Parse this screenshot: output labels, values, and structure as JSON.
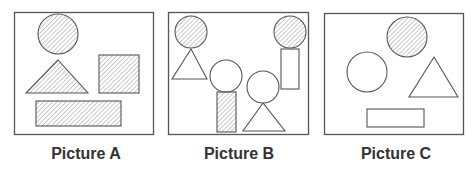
{
  "colors": {
    "stroke": "#555555",
    "frame": "#555555",
    "hatch": "#9a9a9a",
    "caption": "#333333",
    "background": "#ffffff"
  },
  "pictures": [
    {
      "id": "A",
      "label": "Picture A",
      "frame": {
        "x": 14,
        "y": 12,
        "w": 139,
        "h": 122
      },
      "shapes": [
        {
          "type": "circle",
          "cx": 58,
          "cy": 34,
          "r": 20,
          "fill": "hatched"
        },
        {
          "type": "triangle",
          "points": [
            [
              58,
              60
            ],
            [
              26,
              93
            ],
            [
              88,
              93
            ]
          ],
          "fill": "hatched"
        },
        {
          "type": "rect",
          "x": 99,
          "y": 55,
          "w": 40,
          "h": 38,
          "fill": "hatched"
        },
        {
          "type": "rect",
          "x": 36,
          "y": 101,
          "w": 85,
          "h": 25,
          "fill": "hatched"
        }
      ]
    },
    {
      "id": "B",
      "label": "Picture B",
      "frame": {
        "x": 168,
        "y": 12,
        "w": 140,
        "h": 122
      },
      "shapes": [
        {
          "type": "circle",
          "cx": 191,
          "cy": 32,
          "r": 16,
          "fill": "hatched"
        },
        {
          "type": "triangle",
          "points": [
            [
              191,
              49
            ],
            [
              172,
              79
            ],
            [
              207,
              79
            ]
          ],
          "fill": "none"
        },
        {
          "type": "circle",
          "cx": 226,
          "cy": 76,
          "r": 16,
          "fill": "none"
        },
        {
          "type": "rect",
          "x": 217,
          "y": 92,
          "w": 19,
          "h": 40,
          "fill": "hatched"
        },
        {
          "type": "circle",
          "cx": 263,
          "cy": 87,
          "r": 16,
          "fill": "none"
        },
        {
          "type": "triangle",
          "points": [
            [
              263,
              103
            ],
            [
              243,
              131
            ],
            [
              285,
              131
            ]
          ],
          "fill": "none"
        },
        {
          "type": "circle",
          "cx": 290,
          "cy": 32,
          "r": 16,
          "fill": "hatched"
        },
        {
          "type": "rect",
          "x": 281,
          "y": 49,
          "w": 18,
          "h": 40,
          "fill": "none"
        }
      ]
    },
    {
      "id": "C",
      "label": "Picture C",
      "frame": {
        "x": 324,
        "y": 13,
        "w": 139,
        "h": 121
      },
      "shapes": [
        {
          "type": "circle",
          "cx": 407,
          "cy": 37,
          "r": 20,
          "fill": "hatched"
        },
        {
          "type": "circle",
          "cx": 367,
          "cy": 72,
          "r": 20,
          "fill": "none"
        },
        {
          "type": "triangle",
          "points": [
            [
              434,
              57
            ],
            [
              409,
              97
            ],
            [
              458,
              97
            ]
          ],
          "fill": "none"
        },
        {
          "type": "rect",
          "x": 367,
          "y": 109,
          "w": 57,
          "h": 18,
          "fill": "none"
        }
      ]
    }
  ]
}
